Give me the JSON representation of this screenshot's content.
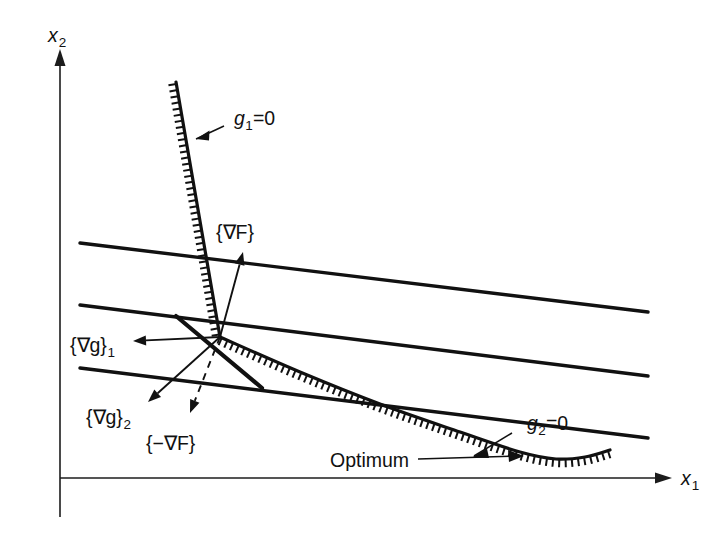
{
  "figure": {
    "type": "constrained-optimization-kkt-diagram",
    "background_color": "#ffffff",
    "ink_color": "#111111"
  },
  "axes": {
    "x_label": "x",
    "x_label_sub": "1",
    "y_label": "x",
    "y_label_sub": "2",
    "origin": {
      "x": 60,
      "y": 478
    }
  },
  "labels": {
    "g1": {
      "base": "g",
      "sub": "1",
      "rest": "=0"
    },
    "g2": {
      "base": "g",
      "sub": "2",
      "rest": "=0"
    },
    "grad_f": "{∇F}",
    "neg_grad_f": "{−∇F}",
    "grad_g1": {
      "base": "{∇g}",
      "sub": "1"
    },
    "grad_g2": {
      "base": "{∇g}",
      "sub": "2"
    },
    "optimum": "Optimum"
  },
  "chart_data": {
    "type": "line",
    "title": "",
    "xlabel": "x1",
    "ylabel": "x2",
    "grid": false,
    "legend": "none",
    "annotations": [
      {
        "text": "g1=0",
        "at": [
          232,
          118
        ],
        "points_to": [
          196,
          140
        ]
      },
      {
        "text": "g2=0",
        "at": [
          525,
          424
        ],
        "points_to": [
          470,
          455
        ]
      },
      {
        "text": "{∇F}",
        "at": [
          243,
          232
        ],
        "points_to": [
          243,
          250
        ]
      },
      {
        "text": "{∇g}1",
        "at": [
          74,
          345
        ],
        "points_to": [
          133,
          341
        ]
      },
      {
        "text": "{∇g}2",
        "at": [
          88,
          418
        ],
        "points_to": [
          146,
          400
        ]
      },
      {
        "text": "{−∇F}",
        "at": [
          150,
          442
        ],
        "points_to": [
          188,
          412
        ]
      },
      {
        "text": "Optimum",
        "at": [
          338,
          462
        ],
        "points_to": [
          522,
          456
        ]
      }
    ],
    "series": [
      {
        "name": "objective-contour-1",
        "kind": "contour",
        "points": [
          [
            80,
            243
          ],
          [
            648,
            312
          ]
        ]
      },
      {
        "name": "objective-contour-2",
        "kind": "contour",
        "points": [
          [
            80,
            305
          ],
          [
            648,
            376
          ]
        ]
      },
      {
        "name": "objective-contour-3",
        "kind": "contour",
        "points": [
          [
            80,
            368
          ],
          [
            648,
            438
          ]
        ]
      },
      {
        "name": "g1-constraint-boundary",
        "kind": "constraint",
        "hatch_side": "right",
        "points": [
          [
            176,
            82
          ],
          [
            220,
            337
          ]
        ]
      },
      {
        "name": "g2-constraint-boundary",
        "kind": "constraint",
        "hatch_side": "below",
        "points": [
          [
            220,
            337
          ],
          [
            300,
            372
          ],
          [
            380,
            404
          ],
          [
            460,
            432
          ],
          [
            520,
            452
          ],
          [
            556,
            459
          ],
          [
            585,
            457
          ],
          [
            610,
            450
          ]
        ]
      },
      {
        "name": "active-constraint-tangent",
        "kind": "tangent",
        "points": [
          [
            176,
            316
          ],
          [
            262,
            388
          ]
        ]
      }
    ],
    "vectors": [
      {
        "name": "grad-F",
        "from": [
          220,
          337
        ],
        "to": [
          243,
          252
        ],
        "style": "solid"
      },
      {
        "name": "grad-g-1",
        "from": [
          220,
          337
        ],
        "to": [
          133,
          341
        ],
        "style": "solid"
      },
      {
        "name": "grad-g-2",
        "from": [
          220,
          337
        ],
        "to": [
          148,
          402
        ],
        "style": "solid"
      },
      {
        "name": "neg-grad-F",
        "from": [
          220,
          337
        ],
        "to": [
          190,
          413
        ],
        "style": "dashed"
      }
    ],
    "optimum_point": [
      522,
      456
    ],
    "intersection_point": [
      220,
      337
    ]
  }
}
